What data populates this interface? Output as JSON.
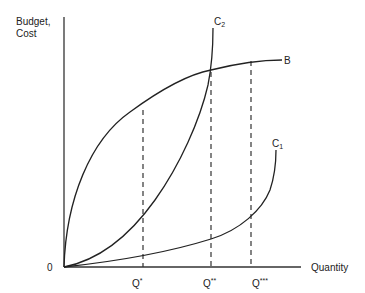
{
  "diagram": {
    "y_axis_label_line1": "Budget,",
    "y_axis_label_line2": "Cost",
    "x_axis_label": "Quantity",
    "origin_label": "0",
    "curves": [
      {
        "name": "B",
        "label": "B",
        "description": "Budget curve, concave, rising from origin"
      },
      {
        "name": "C2",
        "label_main": "C",
        "label_sub": "2",
        "description": "Steep convex cost curve"
      },
      {
        "name": "C1",
        "label_main": "C",
        "label_sub": "1",
        "description": "Flatter convex cost curve"
      }
    ],
    "quantity_markers": [
      {
        "label_main": "Q",
        "label_sup": "*"
      },
      {
        "label_main": "Q",
        "label_sup": "**"
      },
      {
        "label_main": "Q",
        "label_sup": "***"
      }
    ]
  }
}
